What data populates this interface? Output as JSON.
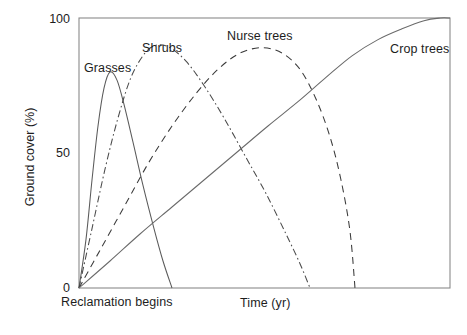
{
  "chart_data": {
    "type": "line",
    "title": "",
    "xlabel": "Time (yr)",
    "ylabel": "Ground cover (%)",
    "x_origin_label": "Reclamation begins",
    "ylim": [
      0,
      100
    ],
    "yticks": [
      0,
      50,
      100
    ],
    "ytick_labels": [
      "0",
      "50",
      "100"
    ],
    "xticks": [],
    "xtick_labels": [],
    "grid": false,
    "legend_position": "inline-annotations",
    "frame": "box",
    "series": [
      {
        "name": "Grasses",
        "linestyle": "solid",
        "color": "#5a5a5a",
        "label_x": 84,
        "label_y": 62,
        "peak_x_px": 110,
        "peak_value": 80,
        "ends_x_px": 172,
        "points": [
          [
            79,
            0
          ],
          [
            86,
            18
          ],
          [
            92,
            40
          ],
          [
            98,
            60
          ],
          [
            104,
            74
          ],
          [
            110,
            80
          ],
          [
            117,
            77
          ],
          [
            124,
            68
          ],
          [
            133,
            54
          ],
          [
            143,
            38
          ],
          [
            154,
            22
          ],
          [
            163,
            10
          ],
          [
            172,
            0
          ]
        ]
      },
      {
        "name": "Shrubs",
        "linestyle": "dashdot",
        "color": "#4a4a4a",
        "label_x": 143,
        "label_y": 42,
        "peak_x_px": 163,
        "peak_value": 90,
        "ends_x_px": 310,
        "points": [
          [
            79,
            0
          ],
          [
            92,
            22
          ],
          [
            105,
            44
          ],
          [
            118,
            63
          ],
          [
            131,
            78
          ],
          [
            145,
            87
          ],
          [
            157,
            90
          ],
          [
            170,
            89
          ],
          [
            186,
            84
          ],
          [
            204,
            75
          ],
          [
            224,
            63
          ],
          [
            245,
            49
          ],
          [
            266,
            35
          ],
          [
            286,
            20
          ],
          [
            300,
            9
          ],
          [
            310,
            0
          ]
        ]
      },
      {
        "name": "Nurse trees",
        "linestyle": "dashed",
        "color": "#3a3a3a",
        "label_x": 227,
        "label_y": 30,
        "peak_x_px": 262,
        "peak_value": 89,
        "ends_x_px": 355,
        "points": [
          [
            79,
            0
          ],
          [
            100,
            14
          ],
          [
            124,
            30
          ],
          [
            148,
            46
          ],
          [
            172,
            60
          ],
          [
            196,
            72
          ],
          [
            218,
            81
          ],
          [
            240,
            87
          ],
          [
            262,
            89
          ],
          [
            282,
            87
          ],
          [
            300,
            81
          ],
          [
            316,
            70
          ],
          [
            330,
            56
          ],
          [
            341,
            40
          ],
          [
            350,
            21
          ],
          [
            355,
            0
          ]
        ]
      },
      {
        "name": "Crop trees",
        "linestyle": "solid",
        "color": "#6a6a6a",
        "label_x": 391,
        "label_y": 43,
        "peak_x_px": 450,
        "peak_value": 100,
        "ends_x_px": 450,
        "points": [
          [
            79,
            0
          ],
          [
            110,
            10
          ],
          [
            140,
            20
          ],
          [
            172,
            30
          ],
          [
            204,
            40
          ],
          [
            236,
            50
          ],
          [
            268,
            60
          ],
          [
            298,
            69
          ],
          [
            326,
            78
          ],
          [
            352,
            86
          ],
          [
            378,
            92
          ],
          [
            402,
            96
          ],
          [
            424,
            99
          ],
          [
            440,
            100
          ],
          [
            450,
            100
          ]
        ]
      }
    ]
  },
  "axes": {
    "y_tick_100": "100",
    "y_tick_50": "50",
    "y_tick_0": "0",
    "y_title": "Ground cover (%)",
    "x_title": "Time (yr)",
    "x_origin_note": "Reclamation begins"
  },
  "labels": {
    "grasses": "Grasses",
    "shrubs": "Shrubs",
    "nurse_trees": "Nurse trees",
    "crop_trees": "Crop trees"
  },
  "colors": {
    "background": "#ffffff",
    "frame": "#8a8a8a",
    "text": "#1d1d1d",
    "grasses": "#5a5a5a",
    "shrubs": "#4a4a4a",
    "nurse_trees": "#3a3a3a",
    "crop_trees": "#6a6a6a"
  }
}
